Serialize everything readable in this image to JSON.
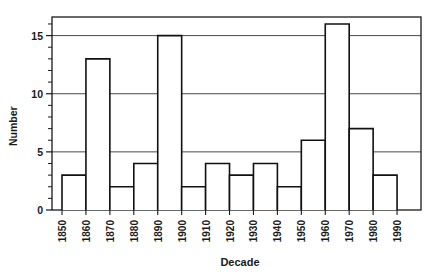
{
  "chart_data": {
    "type": "bar",
    "title": "",
    "subtitle": "",
    "xlabel": "Decade",
    "ylabel": "Number",
    "categories": [
      "1850",
      "1860",
      "1870",
      "1880",
      "1890",
      "1900",
      "1910",
      "1920",
      "1930",
      "1940",
      "1950",
      "1960",
      "1970",
      "1980",
      "1990"
    ],
    "values": [
      3,
      13,
      2,
      4,
      15,
      2,
      4,
      3,
      4,
      2,
      6,
      16,
      7,
      3,
      null
    ],
    "bars": [
      {
        "decade": "1850",
        "value": 3
      },
      {
        "decade": "1860",
        "value": 13
      },
      {
        "decade": "1870",
        "value": 2
      },
      {
        "decade": "1880",
        "value": 4
      },
      {
        "decade": "1890",
        "value": 15
      },
      {
        "decade": "1900",
        "value": 2
      },
      {
        "decade": "1910",
        "value": 4
      },
      {
        "decade": "1920",
        "value": 3
      },
      {
        "decade": "1930",
        "value": 4
      },
      {
        "decade": "1940",
        "value": 2
      },
      {
        "decade": "1950",
        "value": 6
      },
      {
        "decade": "1960",
        "value": 16
      },
      {
        "decade": "1970",
        "value": 7
      },
      {
        "decade": "1980",
        "value": 3
      }
    ],
    "xtick_labels": [
      "1850",
      "1860",
      "1870",
      "1880",
      "1890",
      "1900",
      "1910",
      "1920",
      "1930",
      "1940",
      "1950",
      "1960",
      "1970",
      "1980",
      "1990"
    ],
    "ytick_labels": [
      "0",
      "5",
      "10",
      "15"
    ],
    "ytick_values": [
      0,
      5,
      10,
      15
    ],
    "yminor_step": 1,
    "ylim": [
      0,
      16.6
    ],
    "grid": "horizontal-major",
    "legend": "none",
    "bar_fill": "#ffffff",
    "bar_stroke": "#111111",
    "grid_color": "#333333",
    "axis_color": "#1a1a1a",
    "background": "#ffffff"
  }
}
